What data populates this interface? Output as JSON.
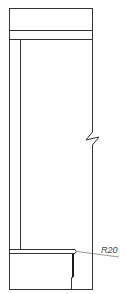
{
  "drawing": {
    "type": "technical-section-drawing",
    "annotations": {
      "radius_label": "R20"
    },
    "colors": {
      "line": "#333333",
      "background": "#ffffff"
    }
  }
}
